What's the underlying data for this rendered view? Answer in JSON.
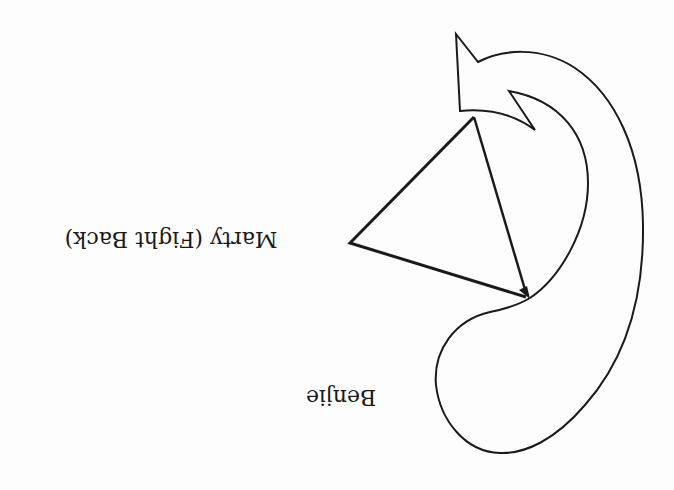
{
  "diagram": {
    "orientation": "rotated 180 degrees",
    "nodes": [
      {
        "id": "marty",
        "label": "Marty (Fight Back)",
        "shape": "triangle"
      },
      {
        "id": "benjie",
        "label": "Benjie",
        "shape": "curved-arrow"
      }
    ],
    "edges": [
      {
        "from": "marty",
        "to": "benjie",
        "style": "arrow"
      }
    ],
    "colors": {
      "stroke": "#1a1a1a",
      "background": "#fdfdfd"
    }
  }
}
